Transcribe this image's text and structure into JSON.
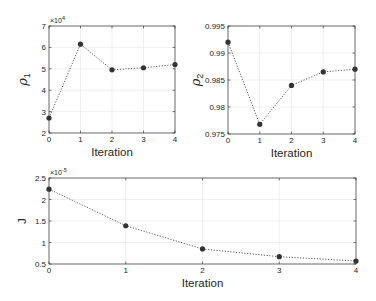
{
  "chart_data": [
    {
      "id": "rho1",
      "type": "line",
      "title": "",
      "xlabel": "Iteration",
      "ylabel": "ρ",
      "ylabel_sub": "1",
      "exponent_label": "×10",
      "exponent_power": "4",
      "x": [
        0,
        1,
        2,
        3,
        4
      ],
      "values": [
        2.7,
        6.15,
        4.95,
        5.05,
        5.2
      ],
      "value_scale": 10000,
      "xlim": [
        0,
        4
      ],
      "ylim": [
        2,
        7
      ],
      "xticks": [
        0,
        1,
        2,
        3,
        4
      ],
      "yticks": [
        2,
        3,
        4,
        5,
        6,
        7
      ],
      "ytick_labels": [
        "2",
        "3",
        "4",
        "5",
        "6",
        "7"
      ],
      "grid": true,
      "line_style": "dotted",
      "marker": "filled-circle",
      "color": "#333333",
      "box": {
        "x": 49,
        "y": 26,
        "w": 126,
        "h": 107
      }
    },
    {
      "id": "rho2",
      "type": "line",
      "title": "",
      "xlabel": "Iteration",
      "ylabel": "ρ",
      "ylabel_sub": "2",
      "exponent_label": "",
      "exponent_power": "",
      "x": [
        0,
        1,
        2,
        3,
        4
      ],
      "values": [
        0.992,
        0.9768,
        0.984,
        0.9865,
        0.987
      ],
      "xlim": [
        0,
        4
      ],
      "ylim": [
        0.975,
        0.995
      ],
      "xticks": [
        0,
        1,
        2,
        3,
        4
      ],
      "yticks": [
        0.975,
        0.98,
        0.985,
        0.99,
        0.995
      ],
      "ytick_labels": [
        "0.975",
        "0.98",
        "0.985",
        "0.99",
        "0.995"
      ],
      "grid": true,
      "line_style": "dotted",
      "marker": "filled-circle",
      "color": "#333333",
      "box": {
        "x": 228,
        "y": 26,
        "w": 127,
        "h": 108
      }
    },
    {
      "id": "J",
      "type": "line",
      "title": "",
      "xlabel": "Iteration",
      "ylabel": "J",
      "ylabel_sub": "",
      "exponent_label": "×10",
      "exponent_power": "-5",
      "x": [
        0,
        1,
        2,
        3,
        4
      ],
      "values": [
        2.24,
        1.39,
        0.85,
        0.67,
        0.57
      ],
      "value_scale": 1e-05,
      "xlim": [
        0,
        4
      ],
      "ylim": [
        0.5,
        2.5
      ],
      "xticks": [
        0,
        1,
        2,
        3,
        4
      ],
      "yticks": [
        0.5,
        1,
        1.5,
        2,
        2.5
      ],
      "ytick_labels": [
        "0.5",
        "1",
        "1.5",
        "2",
        "2.5"
      ],
      "grid": true,
      "line_style": "dotted",
      "marker": "filled-circle",
      "color": "#333333",
      "box": {
        "x": 49,
        "y": 178,
        "w": 307,
        "h": 86
      }
    }
  ]
}
